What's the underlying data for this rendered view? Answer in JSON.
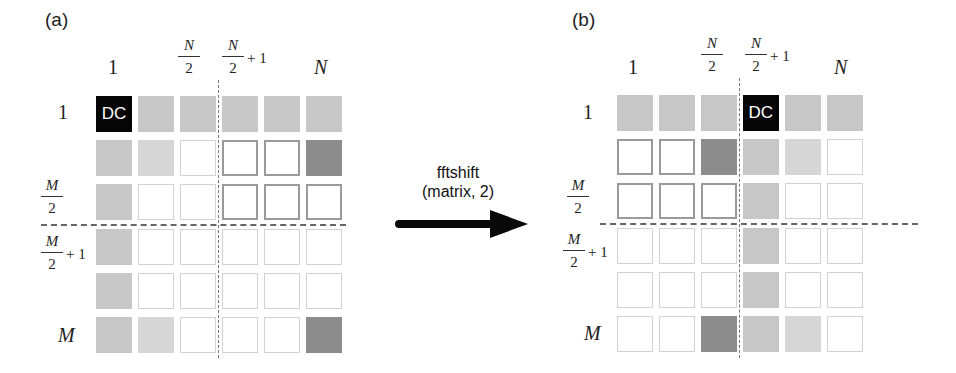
{
  "panel_a": {
    "label": "(a)",
    "col_labels": {
      "first": "1",
      "half_num": "N",
      "half_den": "2",
      "half_plus_num": "N",
      "half_plus_den": "2",
      "plus_one": "+ 1",
      "last": "N"
    },
    "row_labels": {
      "first": "1",
      "half_num": "M",
      "half_den": "2",
      "half_plus_num": "M",
      "half_plus_den": "2",
      "plus_one": "+ 1",
      "last": "M"
    },
    "dc_label": "DC",
    "grid": [
      [
        "dc",
        "mid",
        "mid",
        "mid",
        "mid",
        "mid"
      ],
      [
        "mid",
        "light",
        "white",
        "white-b",
        "white-b",
        "dark"
      ],
      [
        "mid",
        "white",
        "white",
        "white-b",
        "white-b",
        "white-b"
      ],
      [
        "mid",
        "white",
        "white",
        "white",
        "white",
        "white"
      ],
      [
        "mid",
        "white",
        "white",
        "white",
        "white",
        "white"
      ],
      [
        "mid",
        "light",
        "white",
        "white",
        "white",
        "dark"
      ]
    ]
  },
  "panel_b": {
    "label": "(b)",
    "col_labels": {
      "first": "1",
      "half_num": "N",
      "half_den": "2",
      "half_plus_num": "N",
      "half_plus_den": "2",
      "plus_one": "+ 1",
      "last": "N"
    },
    "row_labels": {
      "first": "1",
      "half_num": "M",
      "half_den": "2",
      "half_plus_num": "M",
      "half_plus_den": "2",
      "plus_one": "+ 1",
      "last": "M"
    },
    "dc_label": "DC",
    "grid": [
      [
        "mid",
        "mid",
        "mid",
        "dc",
        "mid",
        "mid"
      ],
      [
        "white-b",
        "white-b",
        "dark",
        "mid",
        "light",
        "white"
      ],
      [
        "white-b",
        "white-b",
        "white-b",
        "mid",
        "white",
        "white"
      ],
      [
        "white",
        "white",
        "white",
        "mid",
        "white",
        "white"
      ],
      [
        "white",
        "white",
        "white",
        "mid",
        "white",
        "white"
      ],
      [
        "white",
        "white",
        "dark",
        "mid",
        "light",
        "white"
      ]
    ]
  },
  "arrow": {
    "line1": "fftshift",
    "line2": "(matrix, 2)"
  },
  "colors": {
    "dc": "#050505",
    "mid": "#c7c7c7",
    "light": "#d6d6d6",
    "dark": "#8c8c8c",
    "white": "#ffffff"
  }
}
